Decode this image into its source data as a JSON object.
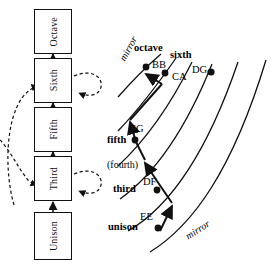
{
  "diagram": {
    "flow": {
      "name": "interval-ladder",
      "nodes": [
        {
          "id": "octave",
          "label": "Octave"
        },
        {
          "id": "sixth",
          "label": "Sixth"
        },
        {
          "id": "fifth",
          "label": "Fifth"
        },
        {
          "id": "third",
          "label": "Third"
        },
        {
          "id": "unison",
          "label": "Unison"
        }
      ],
      "self_loop_nodes": [
        "sixth",
        "third"
      ],
      "edge_style_solid": "solid-arrow",
      "edge_style_dashed": "dashed-arrow"
    },
    "arc_field": {
      "name": "mirror-arc-fan",
      "arc_count": 6,
      "mirror_label_top": "mirror",
      "mirror_label_bottom": "mirror",
      "interval_labels": [
        {
          "id": "octave",
          "text": "octave",
          "weight": "bold"
        },
        {
          "id": "sixth",
          "text": "sixth",
          "weight": "bold"
        },
        {
          "id": "fifth",
          "text": "fifth",
          "weight": "bold"
        },
        {
          "id": "fourth",
          "text": "(fourth)",
          "weight": "normal"
        },
        {
          "id": "third",
          "text": "third",
          "weight": "bold"
        },
        {
          "id": "unison",
          "text": "unison",
          "weight": "bold"
        }
      ],
      "note_pairs": [
        {
          "id": "bb",
          "text": "BB"
        },
        {
          "id": "ca",
          "text": "CA"
        },
        {
          "id": "dg",
          "text": "DG"
        },
        {
          "id": "cg",
          "text": "CG"
        },
        {
          "id": "df",
          "text": "DF"
        },
        {
          "id": "ee",
          "text": "EE"
        }
      ]
    },
    "colors": {
      "ink": "#111111",
      "background": "#ffffff"
    }
  }
}
